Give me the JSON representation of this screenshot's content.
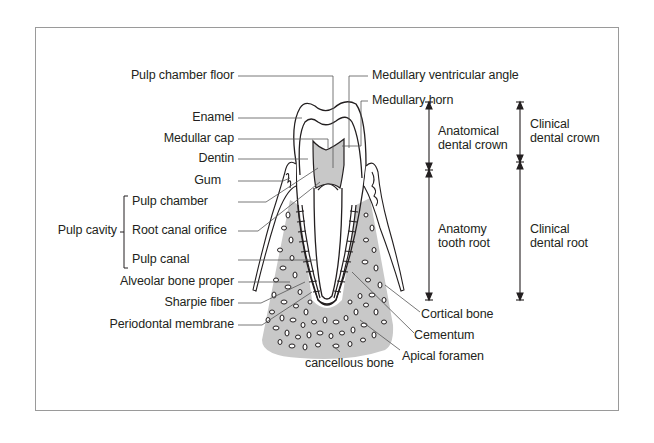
{
  "diagram": {
    "colors": {
      "bone": "#c8c8c8",
      "pulp": "#c8c8c8",
      "line": "#231f20",
      "leader": "#555555",
      "frame": "#9a9a9a"
    },
    "left_labels": [
      {
        "id": "pulp-chamber-floor",
        "text": "Pulp chamber floor"
      },
      {
        "id": "enamel",
        "text": "Enamel"
      },
      {
        "id": "medullar-cap",
        "text": "Medullar cap"
      },
      {
        "id": "dentin",
        "text": "Dentin"
      },
      {
        "id": "gum",
        "text": "Gum"
      },
      {
        "id": "pulp-chamber",
        "text": "Pulp chamber"
      },
      {
        "id": "root-canal-orifice",
        "text": "Root canal orifice"
      },
      {
        "id": "pulp-canal",
        "text": "Pulp canal"
      },
      {
        "id": "alveolar-bone-proper",
        "text": "Alveolar bone proper"
      },
      {
        "id": "sharpie-fiber",
        "text": "Sharpie fiber"
      },
      {
        "id": "periodontal-membrane",
        "text": "Periodontal membrane"
      }
    ],
    "group_label": {
      "text": "Pulp cavity",
      "members": [
        "Pulp chamber",
        "Root canal orifice",
        "Pulp canal"
      ]
    },
    "right_labels": [
      {
        "id": "medullary-ventricular-angle",
        "text": "Medullary ventricular angle"
      },
      {
        "id": "medullary-horn",
        "text": "Medullary horn"
      },
      {
        "id": "cortical-bone",
        "text": "Cortical bone"
      },
      {
        "id": "cementum",
        "text": "Cementum"
      },
      {
        "id": "apical-foramen",
        "text": "Apical foramen"
      },
      {
        "id": "cancellous-bone",
        "text": "cancellous bone"
      }
    ],
    "dimensions": [
      {
        "id": "anatomical-dental-crown",
        "text": "Anatomical\ndental crown"
      },
      {
        "id": "anatomy-tooth-root",
        "text": "Anatomy\ntooth root"
      },
      {
        "id": "clinical-dental-crown",
        "text": "Clinical\ndental crown"
      },
      {
        "id": "clinical-dental-root",
        "text": "Clinical\ndental root"
      }
    ]
  }
}
